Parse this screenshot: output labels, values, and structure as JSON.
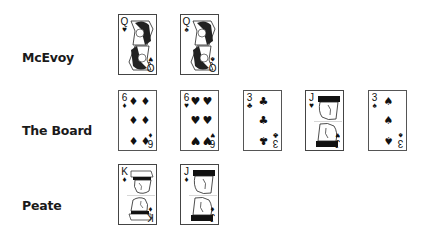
{
  "rows": [
    {
      "player": "McEvoy",
      "cards": [
        {
          "rank": "Q",
          "suit": "♥",
          "suit_name": "hearts"
        },
        {
          "rank": "Q",
          "suit": "♠",
          "suit_name": "spades"
        }
      ]
    },
    {
      "player": "The Board",
      "cards": [
        {
          "rank": "6",
          "suit": "♦",
          "suit_name": "diamonds"
        },
        {
          "rank": "6",
          "suit": "♥",
          "suit_name": "hearts"
        },
        {
          "rank": "3",
          "suit": "♣",
          "suit_name": "clubs"
        },
        {
          "rank": "J",
          "suit": "♥",
          "suit_name": "hearts"
        },
        {
          "rank": "3",
          "suit": "♠",
          "suit_name": "spades"
        }
      ]
    },
    {
      "player": "Peate",
      "cards": [
        {
          "rank": "K",
          "suit": "♦",
          "suit_name": "diamonds"
        },
        {
          "rank": "J",
          "suit": "♦",
          "suit_name": "diamonds"
        }
      ]
    }
  ],
  "colors": {
    "card_ink": "#111111",
    "card_border": "#555555",
    "label": "#1a1a1a",
    "background": "#ffffff"
  }
}
